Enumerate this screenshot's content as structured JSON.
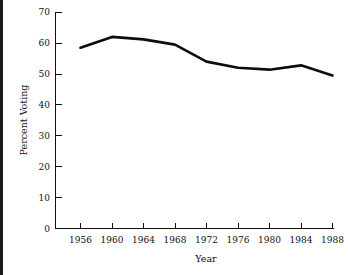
{
  "chart_data": {
    "type": "line",
    "title": "",
    "xlabel": "Year",
    "ylabel": "Percent Voting",
    "x": [
      1956,
      1960,
      1964,
      1968,
      1972,
      1976,
      1980,
      1984,
      1988
    ],
    "values": [
      58.5,
      62.0,
      61.2,
      59.5,
      54.0,
      52.0,
      51.4,
      52.8,
      49.5
    ],
    "series": [
      {
        "name": "Percent Voting",
        "values": [
          58.5,
          62.0,
          61.2,
          59.5,
          54.0,
          52.0,
          51.4,
          52.8,
          49.5
        ]
      }
    ],
    "xlim": [
      1954,
      1990
    ],
    "ylim": [
      0,
      70
    ],
    "xticks": [
      1956,
      1960,
      1964,
      1968,
      1972,
      1976,
      1980,
      1984,
      1988
    ],
    "xtick_labels": [
      "1956",
      "1960",
      "1964",
      "1968",
      "1972",
      "1976",
      "1980",
      "1984",
      "1988"
    ],
    "yticks": [
      0,
      10,
      20,
      30,
      40,
      50,
      60,
      70
    ],
    "ytick_labels": [
      "0",
      "10",
      "20",
      "30",
      "40",
      "50",
      "60",
      "70"
    ],
    "grid": false,
    "legend": false,
    "legend_position": "none",
    "line_color": "#0d0d0d",
    "background_color": "#ffffff",
    "axis_color": "#111111",
    "tick_direction": "in"
  }
}
